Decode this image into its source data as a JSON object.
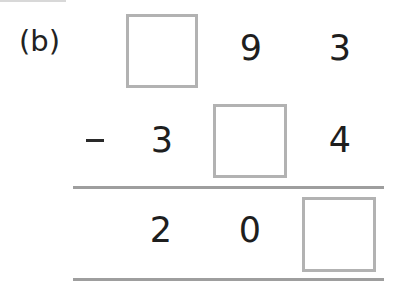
{
  "problem": {
    "label": "(b)",
    "operator": "–",
    "rows": [
      {
        "name": "minuend",
        "cells": [
          {
            "type": "box",
            "value": ""
          },
          {
            "type": "digit",
            "value": "9"
          },
          {
            "type": "digit",
            "value": "3"
          }
        ]
      },
      {
        "name": "subtrahend",
        "cells": [
          {
            "type": "digit",
            "value": "3"
          },
          {
            "type": "box",
            "value": ""
          },
          {
            "type": "digit",
            "value": "4"
          }
        ]
      },
      {
        "name": "difference",
        "cells": [
          {
            "type": "digit",
            "value": "2"
          },
          {
            "type": "digit",
            "value": "0"
          },
          {
            "type": "box",
            "value": ""
          }
        ]
      }
    ]
  },
  "colors": {
    "text": "#1e1e1e",
    "box_border": "#b2b2b2",
    "rule": "#9e9e9e"
  }
}
